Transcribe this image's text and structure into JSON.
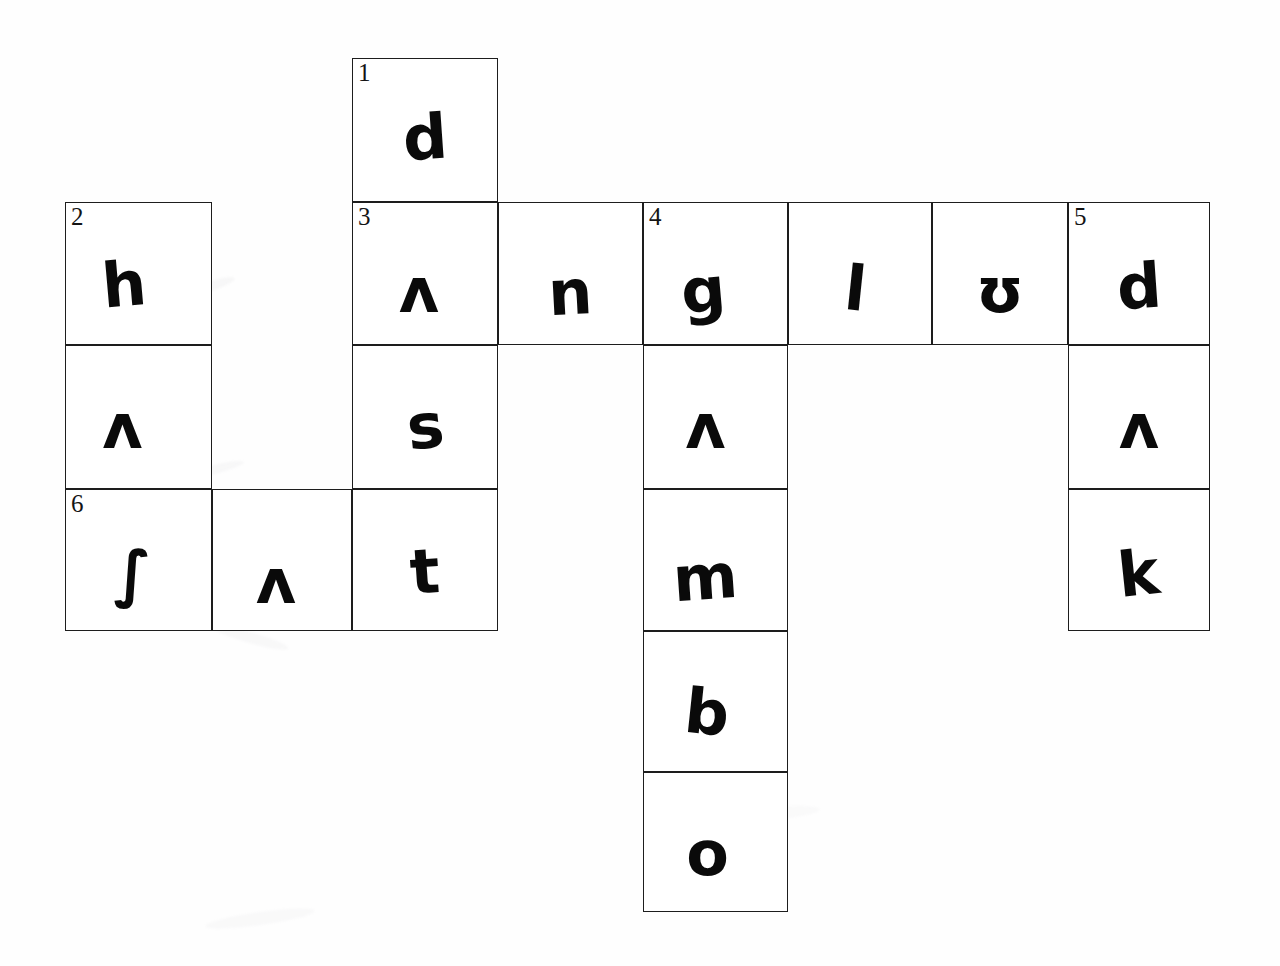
{
  "sheet": {
    "title": "Handwritten crossword grid",
    "background_color": "#ffffff",
    "ink_color": "#0a0a0a",
    "grid_line_color": "#1d1d1d",
    "width": 1280,
    "height": 966
  },
  "grid": {
    "columns": 8,
    "rows": 6,
    "cell_width": 145,
    "cell_height": 143,
    "origin_x": 65,
    "origin_y": 58,
    "column_edges": [
      65,
      212,
      352,
      498,
      643,
      788,
      932,
      1068,
      1210
    ],
    "row_edges": [
      58,
      202,
      345,
      489,
      631,
      772,
      912
    ]
  },
  "clue_numbers": [
    {
      "number": "1",
      "row": 1,
      "col": 3
    },
    {
      "number": "2",
      "row": 2,
      "col": 1
    },
    {
      "number": "3",
      "row": 2,
      "col": 3
    },
    {
      "number": "4",
      "row": 2,
      "col": 5
    },
    {
      "number": "5",
      "row": 2,
      "col": 8
    },
    {
      "number": "6",
      "row": 4,
      "col": 1
    }
  ],
  "cells": [
    {
      "id": "r1c3",
      "row": 1,
      "col": 3,
      "number": "1",
      "letter": "d",
      "rotate": -4,
      "dx": 0,
      "dy": 0
    },
    {
      "id": "r2c1",
      "row": 2,
      "col": 1,
      "number": "2",
      "letter": "h",
      "rotate": -5,
      "dx": -14,
      "dy": 4
    },
    {
      "id": "r2c3",
      "row": 2,
      "col": 3,
      "number": "3",
      "letter": "ʌ",
      "rotate": 0,
      "dx": -6,
      "dy": 10
    },
    {
      "id": "r2c4",
      "row": 2,
      "col": 4,
      "number": "",
      "letter": "n",
      "rotate": -3,
      "dx": 0,
      "dy": 12
    },
    {
      "id": "r2c5",
      "row": 2,
      "col": 5,
      "number": "4",
      "letter": "g",
      "rotate": -5,
      "dx": -12,
      "dy": 10
    },
    {
      "id": "r2c6",
      "row": 2,
      "col": 6,
      "number": "",
      "letter": "l",
      "rotate": 6,
      "dx": -4,
      "dy": 8
    },
    {
      "id": "r2c7",
      "row": 2,
      "col": 7,
      "number": "",
      "letter": "ʊ",
      "rotate": 0,
      "dx": 0,
      "dy": 10
    },
    {
      "id": "r2c8",
      "row": 2,
      "col": 8,
      "number": "5",
      "letter": "d",
      "rotate": -4,
      "dx": 0,
      "dy": 6
    },
    {
      "id": "r3c1",
      "row": 3,
      "col": 1,
      "number": "",
      "letter": "ʌ",
      "rotate": 0,
      "dx": -16,
      "dy": 2
    },
    {
      "id": "r3c3",
      "row": 3,
      "col": 3,
      "number": "",
      "letter": "s",
      "rotate": -6,
      "dx": 0,
      "dy": 2
    },
    {
      "id": "r3c5",
      "row": 3,
      "col": 5,
      "number": "",
      "letter": "ʌ",
      "rotate": 0,
      "dx": -10,
      "dy": 2
    },
    {
      "id": "r3c8",
      "row": 3,
      "col": 8,
      "number": "",
      "letter": "ʌ",
      "rotate": 0,
      "dx": 0,
      "dy": 2
    },
    {
      "id": "r4c1",
      "row": 4,
      "col": 1,
      "number": "6",
      "letter": "∫",
      "rotate": 0,
      "dx": -6,
      "dy": 6
    },
    {
      "id": "r4c2",
      "row": 4,
      "col": 2,
      "number": "",
      "letter": "ʌ",
      "rotate": 0,
      "dx": -6,
      "dy": 14
    },
    {
      "id": "r4c3",
      "row": 4,
      "col": 3,
      "number": "",
      "letter": "t",
      "rotate": -4,
      "dx": 0,
      "dy": 4
    },
    {
      "id": "r4c5",
      "row": 4,
      "col": 5,
      "number": "",
      "letter": "m",
      "rotate": -4,
      "dx": -10,
      "dy": 10
    },
    {
      "id": "r4c8",
      "row": 4,
      "col": 8,
      "number": "",
      "letter": "k",
      "rotate": -6,
      "dx": 0,
      "dy": 6
    },
    {
      "id": "r5c5",
      "row": 5,
      "col": 5,
      "number": "",
      "letter": "b",
      "rotate": 6,
      "dx": -8,
      "dy": 4
    },
    {
      "id": "r6c5",
      "row": 6,
      "col": 5,
      "number": "",
      "letter": "o",
      "rotate": 0,
      "dx": -8,
      "dy": 4
    }
  ],
  "answers": {
    "across": [
      {
        "number": "3",
        "text": "ʌngʊlʊd",
        "start_row": 2,
        "start_col": 3,
        "length": 6
      },
      {
        "number": "6",
        "text": "∫ʌt",
        "start_row": 4,
        "start_col": 1,
        "length": 3
      }
    ],
    "down": [
      {
        "number": "1",
        "text": "dʌs t",
        "start_row": 1,
        "start_col": 3,
        "length": 4
      },
      {
        "number": "2",
        "text": "hʌ∫",
        "start_row": 2,
        "start_col": 1,
        "length": 3
      },
      {
        "number": "4",
        "text": "gʌmbo",
        "start_row": 2,
        "start_col": 5,
        "length": 5
      },
      {
        "number": "5",
        "text": "dʌk",
        "start_row": 2,
        "start_col": 8,
        "length": 3
      }
    ]
  },
  "smudges": [
    {
      "x": 180,
      "y": 282,
      "w": 56,
      "h": 10,
      "r": -18,
      "o": 0.28
    },
    {
      "x": 432,
      "y": 200,
      "w": 90,
      "h": 12,
      "r": 22,
      "o": 0.22
    },
    {
      "x": 175,
      "y": 466,
      "w": 70,
      "h": 9,
      "r": -14,
      "o": 0.25
    },
    {
      "x": 210,
      "y": 632,
      "w": 80,
      "h": 11,
      "r": 16,
      "o": 0.24
    },
    {
      "x": 205,
      "y": 912,
      "w": 110,
      "h": 13,
      "r": -8,
      "o": 0.2
    },
    {
      "x": 735,
      "y": 263,
      "w": 40,
      "h": 9,
      "r": 10,
      "o": 0.35
    },
    {
      "x": 690,
      "y": 808,
      "w": 130,
      "h": 14,
      "r": -5,
      "o": 0.16
    }
  ]
}
